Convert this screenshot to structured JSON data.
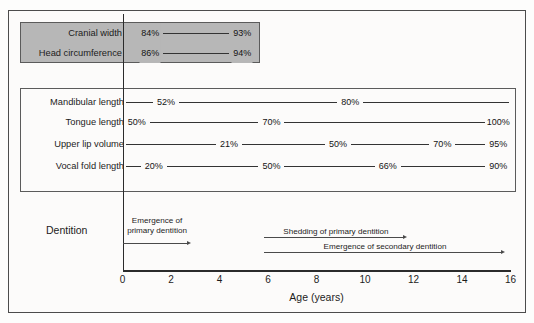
{
  "chart_data": {
    "type": "line",
    "xlabel": "Age (years)",
    "ylabel": "",
    "xlim": [
      0,
      16
    ],
    "xticks": [
      0,
      2,
      4,
      6,
      8,
      10,
      12,
      14,
      16
    ],
    "grid": false,
    "legend": "none",
    "units": "percent of adult value",
    "groups": [
      {
        "name": "shaded-group",
        "shaded": true,
        "shade_color": "#b7b7b7",
        "series": [
          {
            "name": "Cranial width",
            "points": [
              {
                "age": 1.1,
                "label": "84%",
                "value": 84
              },
              {
                "age": 4.9,
                "label": "93%",
                "value": 93
              }
            ],
            "line_start_age": 1.8,
            "line_end_age": 4.3
          },
          {
            "name": "Head circumference",
            "points": [
              {
                "age": 1.1,
                "label": "86%",
                "value": 86
              },
              {
                "age": 4.9,
                "label": "94%",
                "value": 94
              }
            ],
            "line_start_age": 1.8,
            "line_end_age": 4.3
          }
        ]
      },
      {
        "name": "unshaded-group",
        "shaded": false,
        "series": [
          {
            "name": "Mandibular length",
            "points": [
              {
                "age": 1.75,
                "label": "52%",
                "value": 52
              },
              {
                "age": 9.35,
                "label": "80%",
                "value": 80
              }
            ],
            "line_start_age": 0.1,
            "line_end_age": 15.9
          },
          {
            "name": "Tongue length",
            "points": [
              {
                "age": 0.55,
                "label": "50%",
                "value": 50
              },
              {
                "age": 6.1,
                "label": "70%",
                "value": 70
              },
              {
                "age": 15.45,
                "label": "100%",
                "value": 100
              }
            ],
            "line_start_age": 0.1,
            "line_end_age": 15.9
          },
          {
            "name": "Upper lip volume",
            "points": [
              {
                "age": 4.35,
                "label": "21%",
                "value": 21
              },
              {
                "age": 8.85,
                "label": "50%",
                "value": 50
              },
              {
                "age": 13.15,
                "label": "70%",
                "value": 70
              },
              {
                "age": 15.45,
                "label": "95%",
                "value": 95
              }
            ],
            "line_start_age": 0.1,
            "line_end_age": 15.9
          },
          {
            "name": "Vocal fold length",
            "points": [
              {
                "age": 1.25,
                "label": "20%",
                "value": 20
              },
              {
                "age": 6.1,
                "label": "50%",
                "value": 50
              },
              {
                "age": 10.9,
                "label": "66%",
                "value": 66
              },
              {
                "age": 15.45,
                "label": "90%",
                "value": 90
              }
            ],
            "line_start_age": 0.1,
            "line_end_age": 15.9
          }
        ]
      }
    ],
    "dentition": {
      "row_label": "Dentition",
      "events": [
        {
          "label_line1": "Emergence of",
          "label_line2": "primary dentition",
          "start_age": 0.0,
          "end_age": 2.85
        },
        {
          "label_line1": "Shedding of primary dentition",
          "label_line2": "",
          "start_age": 5.85,
          "end_age": 11.75
        },
        {
          "label_line1": "Emergence of secondary dentition",
          "label_line2": "",
          "start_age": 5.85,
          "end_age": 15.8
        }
      ]
    }
  },
  "labels": {
    "cranial_width": "Cranial width",
    "head_circumference": "Head circumference",
    "mandibular_length": "Mandibular length",
    "tongue_length": "Tongue length",
    "upper_lip_volume": "Upper lip volume",
    "vocal_fold_length": "Vocal fold length",
    "dentition": "Dentition",
    "axis_title": "Age (years)"
  },
  "percentages": {
    "cranial_width": [
      "84%",
      "93%"
    ],
    "head_circumference": [
      "86%",
      "94%"
    ],
    "mandibular_length": [
      "52%",
      "80%"
    ],
    "tongue_length": [
      "50%",
      "70%",
      "100%"
    ],
    "upper_lip_volume": [
      "21%",
      "50%",
      "70%",
      "95%"
    ],
    "vocal_fold_length": [
      "20%",
      "50%",
      "66%",
      "90%"
    ]
  },
  "dentition_text": {
    "primary_l1": "Emergence of",
    "primary_l2": "primary dentition",
    "shedding": "Shedding of primary dentition",
    "secondary": "Emergence of secondary dentition"
  },
  "ticks": [
    "0",
    "2",
    "4",
    "6",
    "8",
    "10",
    "12",
    "14",
    "16"
  ],
  "colors": {
    "frame": "#4c4c4c",
    "shade": "#b7b7b7",
    "line": "#333333",
    "text": "#1c1c1c",
    "background": "#fcfbfa"
  }
}
